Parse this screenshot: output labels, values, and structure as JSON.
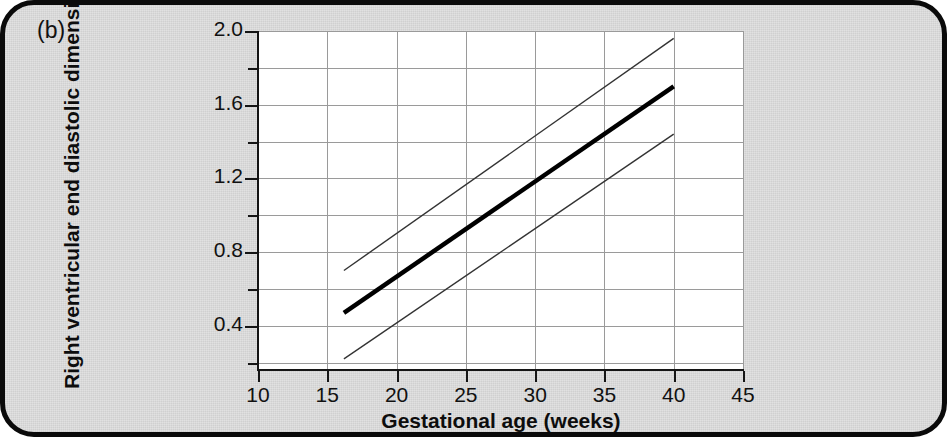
{
  "figure": {
    "panel_label": "(b)",
    "background_color": "#dfdfdf",
    "border_color": "#0a0a0a"
  },
  "chart_data": {
    "type": "line",
    "title": "",
    "subtitle": "",
    "xlabel": "Gestational age (weeks)",
    "ylabel": "Right ventricular end diastolic dimension (cm)",
    "xlim": [
      10,
      45
    ],
    "ylim": [
      0.16,
      2.0
    ],
    "x_ticks": [
      10,
      15,
      20,
      25,
      30,
      35,
      40,
      45
    ],
    "x_tick_labels": [
      "10",
      "15",
      "20",
      "25",
      "30",
      "35",
      "40",
      "45"
    ],
    "y_ticks": [
      0.4,
      0.8,
      1.2,
      1.6,
      2.0
    ],
    "y_tick_labels": [
      "0.4",
      "0.8",
      "1.2",
      "1.6",
      "2.0"
    ],
    "y_minor_ticks": [
      0.2,
      0.6,
      1.0,
      1.4,
      1.8
    ],
    "grid": true,
    "grid_color": "#9a9a9a",
    "legend": "none",
    "x": [
      16.2,
      40.0
    ],
    "series": [
      {
        "name": "upper limit",
        "style": "thin",
        "color": "#333333",
        "values": [
          0.7,
          1.96
        ]
      },
      {
        "name": "mean",
        "style": "bold",
        "color": "#000000",
        "values": [
          0.47,
          1.7
        ]
      },
      {
        "name": "lower limit",
        "style": "thin",
        "color": "#333333",
        "values": [
          0.22,
          1.44
        ]
      }
    ]
  }
}
